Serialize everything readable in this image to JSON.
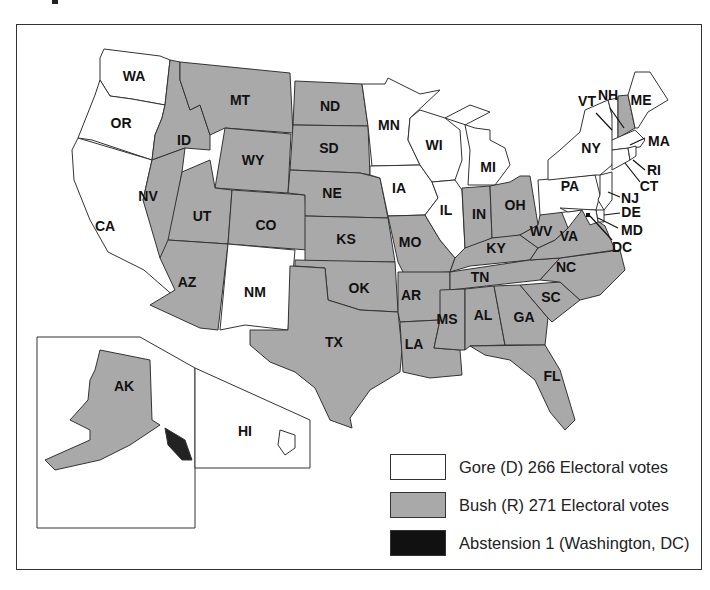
{
  "map": {
    "title": "2000 Presidential Election Results",
    "colors": {
      "gore": "#ffffff",
      "bush": "#a9a9a9",
      "abstention": "#111111",
      "border": "#333333"
    },
    "states": [
      {
        "abbr": "WA",
        "winner": "gore"
      },
      {
        "abbr": "OR",
        "winner": "gore"
      },
      {
        "abbr": "CA",
        "winner": "gore"
      },
      {
        "abbr": "ID",
        "winner": "bush"
      },
      {
        "abbr": "MT",
        "winner": "bush"
      },
      {
        "abbr": "WY",
        "winner": "bush"
      },
      {
        "abbr": "NV",
        "winner": "bush"
      },
      {
        "abbr": "UT",
        "winner": "bush"
      },
      {
        "abbr": "CO",
        "winner": "bush"
      },
      {
        "abbr": "AZ",
        "winner": "bush"
      },
      {
        "abbr": "NM",
        "winner": "gore"
      },
      {
        "abbr": "ND",
        "winner": "bush"
      },
      {
        "abbr": "SD",
        "winner": "bush"
      },
      {
        "abbr": "NE",
        "winner": "bush"
      },
      {
        "abbr": "KS",
        "winner": "bush"
      },
      {
        "abbr": "OK",
        "winner": "bush"
      },
      {
        "abbr": "TX",
        "winner": "bush"
      },
      {
        "abbr": "MN",
        "winner": "gore"
      },
      {
        "abbr": "IA",
        "winner": "gore"
      },
      {
        "abbr": "MO",
        "winner": "bush"
      },
      {
        "abbr": "AR",
        "winner": "bush"
      },
      {
        "abbr": "LA",
        "winner": "bush"
      },
      {
        "abbr": "WI",
        "winner": "gore"
      },
      {
        "abbr": "IL",
        "winner": "gore"
      },
      {
        "abbr": "MI",
        "winner": "gore"
      },
      {
        "abbr": "IN",
        "winner": "bush"
      },
      {
        "abbr": "OH",
        "winner": "bush"
      },
      {
        "abbr": "KY",
        "winner": "bush"
      },
      {
        "abbr": "TN",
        "winner": "bush"
      },
      {
        "abbr": "MS",
        "winner": "bush"
      },
      {
        "abbr": "AL",
        "winner": "bush"
      },
      {
        "abbr": "GA",
        "winner": "bush"
      },
      {
        "abbr": "FL",
        "winner": "bush"
      },
      {
        "abbr": "SC",
        "winner": "bush"
      },
      {
        "abbr": "NC",
        "winner": "bush"
      },
      {
        "abbr": "VA",
        "winner": "bush"
      },
      {
        "abbr": "WV",
        "winner": "bush"
      },
      {
        "abbr": "PA",
        "winner": "gore"
      },
      {
        "abbr": "NY",
        "winner": "gore"
      },
      {
        "abbr": "VT",
        "winner": "gore"
      },
      {
        "abbr": "NH",
        "winner": "bush"
      },
      {
        "abbr": "ME",
        "winner": "gore"
      },
      {
        "abbr": "MA",
        "winner": "gore"
      },
      {
        "abbr": "RI",
        "winner": "gore"
      },
      {
        "abbr": "CT",
        "winner": "gore"
      },
      {
        "abbr": "NJ",
        "winner": "gore"
      },
      {
        "abbr": "DE",
        "winner": "gore"
      },
      {
        "abbr": "MD",
        "winner": "gore"
      },
      {
        "abbr": "DC",
        "winner": "abstention"
      },
      {
        "abbr": "AK",
        "winner": "bush"
      },
      {
        "abbr": "HI",
        "winner": "gore"
      }
    ],
    "labels": {
      "WA": "WA",
      "OR": "OR",
      "CA": "CA",
      "ID": "ID",
      "MT": "MT",
      "WY": "WY",
      "NV": "NV",
      "UT": "UT",
      "CO": "CO",
      "AZ": "AZ",
      "NM": "NM",
      "ND": "ND",
      "SD": "SD",
      "NE": "NE",
      "KS": "KS",
      "OK": "OK",
      "TX": "TX",
      "MN": "MN",
      "IA": "IA",
      "MO": "MO",
      "AR": "AR",
      "LA": "LA",
      "WI": "WI",
      "IL": "IL",
      "MI": "MI",
      "IN": "IN",
      "OH": "OH",
      "KY": "KY",
      "TN": "TN",
      "MS": "MS",
      "AL": "AL",
      "GA": "GA",
      "FL": "FL",
      "SC": "SC",
      "NC": "NC",
      "VA": "VA",
      "WV": "WV",
      "PA": "PA",
      "NY": "NY",
      "VT": "VT",
      "NH": "NH",
      "ME": "ME",
      "MA": "MA",
      "RI": "RI",
      "CT": "CT",
      "NJ": "NJ",
      "DE": "DE",
      "MD": "MD",
      "DC": "DC",
      "AK": "AK",
      "HI": "HI"
    }
  },
  "legend": {
    "items": [
      {
        "key": "gore",
        "label": "Gore (D) 266 Electoral votes",
        "color": "#ffffff"
      },
      {
        "key": "bush",
        "label": "Bush (R) 271 Electoral votes",
        "color": "#a9a9a9"
      },
      {
        "key": "abstention",
        "label": "Abstension 1 (Washington, DC)",
        "color": "#111111"
      }
    ]
  }
}
